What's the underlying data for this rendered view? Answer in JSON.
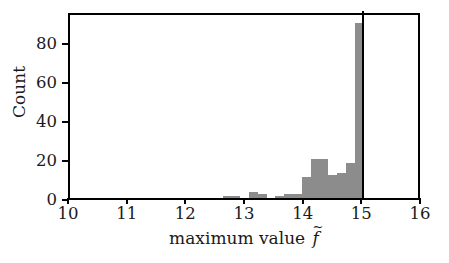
{
  "chart_data": {
    "type": "bar",
    "title": "",
    "subtitle": "",
    "xlabel": "maximum value f̃",
    "xlabel_text": "maximum value",
    "xlabel_symbol": "f",
    "xlabel_symbol_accent": "~",
    "ylabel": "Count",
    "xlim": [
      10,
      16
    ],
    "ylim": [
      0,
      96
    ],
    "grid": false,
    "legend": null,
    "legend_position": "none",
    "xticks": [
      10,
      11,
      12,
      13,
      14,
      15,
      16
    ],
    "xticklabels": [
      "10",
      "11",
      "12",
      "13",
      "14",
      "15",
      "16"
    ],
    "yticks": [
      0,
      20,
      40,
      60,
      80
    ],
    "yticklabels": [
      "0",
      "20",
      "40",
      "60",
      "80"
    ],
    "bar_color": "#8c8c8c",
    "axis_color": "#000000",
    "bin_width": 0.15,
    "bins": [
      {
        "x0": 12.6,
        "x1": 12.75,
        "count": 1
      },
      {
        "x0": 12.75,
        "x1": 12.9,
        "count": 1
      },
      {
        "x0": 13.05,
        "x1": 13.2,
        "count": 3
      },
      {
        "x0": 13.2,
        "x1": 13.35,
        "count": 2
      },
      {
        "x0": 13.5,
        "x1": 13.65,
        "count": 1
      },
      {
        "x0": 13.65,
        "x1": 13.8,
        "count": 2
      },
      {
        "x0": 13.8,
        "x1": 13.95,
        "count": 2
      },
      {
        "x0": 13.95,
        "x1": 14.1,
        "count": 11
      },
      {
        "x0": 14.1,
        "x1": 14.25,
        "count": 20
      },
      {
        "x0": 14.25,
        "x1": 14.4,
        "count": 20
      },
      {
        "x0": 14.4,
        "x1": 14.55,
        "count": 12
      },
      {
        "x0": 14.55,
        "x1": 14.7,
        "count": 13
      },
      {
        "x0": 14.7,
        "x1": 14.85,
        "count": 18
      },
      {
        "x0": 14.85,
        "x1": 15.0,
        "count": 90
      }
    ],
    "annotations": [
      {
        "name": "cutoff-line",
        "type": "vline",
        "x": 15.0,
        "color": "#000000"
      }
    ]
  }
}
